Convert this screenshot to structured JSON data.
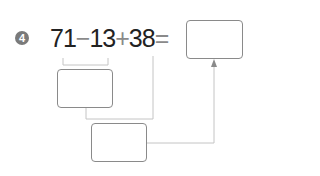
{
  "problem": {
    "number": "4",
    "operands": [
      "71",
      "13",
      "38"
    ],
    "operators": [
      "−",
      "+",
      "="
    ],
    "answer_box": "",
    "step1_box": "",
    "step2_box": ""
  },
  "colors": {
    "badge": "#7a7a7a",
    "text": "#222222",
    "operator": "#8a8a8a",
    "box_border": "#8a8a8a",
    "connector": "#c4c4c4",
    "arrow": "#9a9a9a"
  }
}
